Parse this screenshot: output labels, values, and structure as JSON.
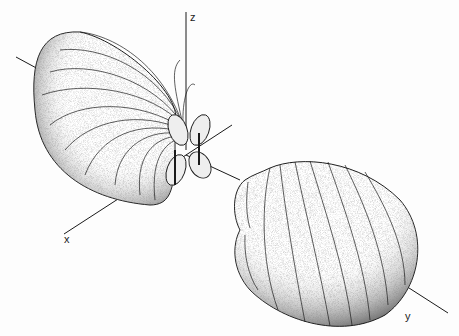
{
  "figure": {
    "type": "3D radiation pattern illustration",
    "axes": {
      "z": {
        "label": "z"
      },
      "x": {
        "label": "x"
      },
      "y": {
        "label": "y"
      }
    },
    "lobes": [
      {
        "name": "upper-left main lobe",
        "direction": "-y / +z"
      },
      {
        "name": "lower-right main lobe",
        "direction": "+y"
      },
      {
        "name": "central small lobes",
        "count": 4
      }
    ],
    "colors": {
      "line": "#1a1a1a",
      "shade": "#555555",
      "background": "#fdfdfd"
    }
  }
}
